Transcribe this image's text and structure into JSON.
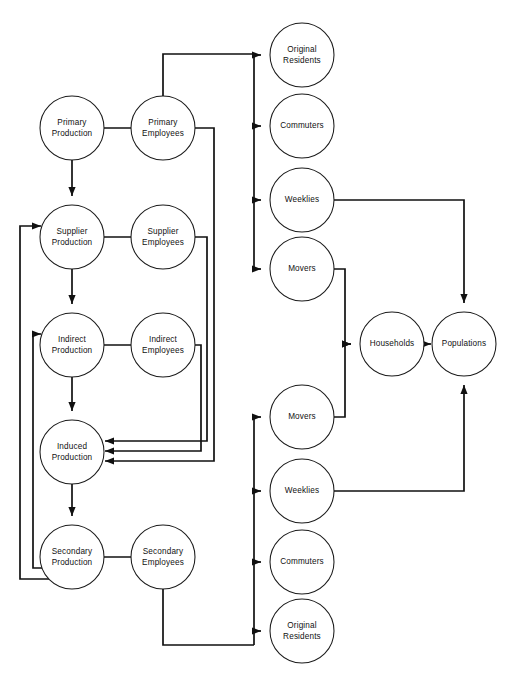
{
  "diagram": {
    "type": "flow-diagram",
    "title": "",
    "nodes": [
      {
        "id": "primary_production",
        "label_line1": "Primary",
        "label_line2": "Production",
        "cx": 72,
        "cy": 128,
        "r": 32
      },
      {
        "id": "primary_employees",
        "label_line1": "Primary",
        "label_line2": "Employees",
        "cx": 163,
        "cy": 128,
        "r": 32
      },
      {
        "id": "supplier_production",
        "label_line1": "Supplier",
        "label_line2": "Production",
        "cx": 72,
        "cy": 237,
        "r": 32
      },
      {
        "id": "supplier_employees",
        "label_line1": "Supplier",
        "label_line2": "Employees",
        "cx": 163,
        "cy": 237,
        "r": 32
      },
      {
        "id": "indirect_production",
        "label_line1": "Indirect",
        "label_line2": "Production",
        "cx": 72,
        "cy": 345,
        "r": 32
      },
      {
        "id": "indirect_employees",
        "label_line1": "Indirect",
        "label_line2": "Employees",
        "cx": 163,
        "cy": 345,
        "r": 32
      },
      {
        "id": "induced_production",
        "label_line1": "Induced",
        "label_line2": "Production",
        "cx": 72,
        "cy": 452,
        "r": 32
      },
      {
        "id": "secondary_production",
        "label_line1": "Secondary",
        "label_line2": "Production",
        "cx": 72,
        "cy": 557,
        "r": 32
      },
      {
        "id": "secondary_employees",
        "label_line1": "Secondary",
        "label_line2": "Employees",
        "cx": 163,
        "cy": 557,
        "r": 32
      },
      {
        "id": "original_residents_top",
        "label_line1": "Original",
        "label_line2": "Residents",
        "cx": 302,
        "cy": 55,
        "r": 32
      },
      {
        "id": "commuters_top",
        "label_line1": "Commuters",
        "label_line2": "",
        "cx": 302,
        "cy": 126,
        "r": 32
      },
      {
        "id": "weeklies_top",
        "label_line1": "Weeklies",
        "label_line2": "",
        "cx": 302,
        "cy": 200,
        "r": 32
      },
      {
        "id": "movers_top",
        "label_line1": "Movers",
        "label_line2": "",
        "cx": 302,
        "cy": 269,
        "r": 32
      },
      {
        "id": "households",
        "label_line1": "Households",
        "label_line2": "",
        "cx": 392,
        "cy": 344,
        "r": 32
      },
      {
        "id": "populations",
        "label_line1": "Populations",
        "label_line2": "",
        "cx": 464,
        "cy": 344,
        "r": 32
      },
      {
        "id": "movers_bottom",
        "label_line1": "Movers",
        "label_line2": "",
        "cx": 302,
        "cy": 417,
        "r": 32
      },
      {
        "id": "weeklies_bottom",
        "label_line1": "Weeklies",
        "label_line2": "",
        "cx": 302,
        "cy": 491,
        "r": 32
      },
      {
        "id": "commuters_bottom",
        "label_line1": "Commuters",
        "label_line2": "",
        "cx": 302,
        "cy": 562,
        "r": 32
      },
      {
        "id": "original_residents_bottom",
        "label_line1": "Original",
        "label_line2": "Residents",
        "cx": 302,
        "cy": 631,
        "r": 32
      }
    ],
    "edges": [
      {
        "id": "e-pp-pe",
        "from": "primary_production",
        "to": "primary_employees",
        "path": "M 104 128 L 154 128",
        "arrow_at": "154,128",
        "arrow_dir": "right"
      },
      {
        "id": "e-pp-sp",
        "from": "primary_production",
        "to": "supplier_production",
        "path": "M 72 160 L 72 196",
        "arrow_at": "72,196",
        "arrow_dir": "down"
      },
      {
        "id": "e-sp-se",
        "from": "supplier_production",
        "to": "supplier_employees",
        "path": "M 104 237 L 154 237",
        "arrow_at": "154,237",
        "arrow_dir": "right"
      },
      {
        "id": "e-sp-ip",
        "from": "supplier_production",
        "to": "indirect_production",
        "path": "M 72 269 L 72 304",
        "arrow_at": "72,304",
        "arrow_dir": "down"
      },
      {
        "id": "e-ip-ie",
        "from": "indirect_production",
        "to": "indirect_employees",
        "path": "M 104 345 L 154 345",
        "arrow_at": "154,345",
        "arrow_dir": "right"
      },
      {
        "id": "e-ip-indp",
        "from": "indirect_production",
        "to": "induced_production",
        "path": "M 72 377 L 72 411",
        "arrow_at": "72,411",
        "arrow_dir": "down"
      },
      {
        "id": "e-indp-sep",
        "from": "induced_production",
        "to": "secondary_production",
        "path": "M 72 484 L 72 516",
        "arrow_at": "72,516",
        "arrow_dir": "down"
      },
      {
        "id": "e-sep-see",
        "from": "secondary_production",
        "to": "secondary_employees",
        "path": "M 104 557 L 154 557",
        "arrow_at": "154,557",
        "arrow_dir": "right"
      },
      {
        "id": "e-see-ind1",
        "from": "supplier_employees",
        "to": "induced_production",
        "path": "M 195 237 L 207 237 L 207 441 L 105 441",
        "arrow_at": "105,441",
        "arrow_dir": "left"
      },
      {
        "id": "e-ie-ind2",
        "from": "indirect_employees",
        "to": "induced_production",
        "path": "M 195 345 L 201 345 L 201 451 L 105 451",
        "arrow_at": "105,451",
        "arrow_dir": "left"
      },
      {
        "id": "e-pe-ind3",
        "from": "primary_employees",
        "to": "induced_production",
        "path": "M 195 128 L 214 128 L 214 461 L 105 461",
        "arrow_at": "105,461",
        "arrow_dir": "left"
      },
      {
        "id": "e-secp-supp-fb",
        "from": "secondary_production",
        "to": "supplier_production",
        "path": "M 51 579 L 20 579 L 20 226 L 41 226",
        "arrow_at": "41,226",
        "arrow_dir": "right"
      },
      {
        "id": "e-secp-indp-fb",
        "from": "secondary_production",
        "to": "indirect_production",
        "path": "M 51 568 L 33 568 L 33 334 L 41 334",
        "arrow_at": "41,334",
        "arrow_dir": "right"
      },
      {
        "id": "e-pe-bus",
        "from": "primary_employees",
        "to": "distribution_bus_top",
        "path": "M 163 96 L 163 54 L 254 54",
        "arrow_at": "",
        "arrow_dir": "none"
      },
      {
        "id": "e-bus-top-vert",
        "from": "distribution_bus_top",
        "to": "distribution_bus_top_end",
        "path": "M 254 54 L 254 269",
        "arrow_at": "",
        "arrow_dir": "none"
      },
      {
        "id": "e-bus-or",
        "from": "distribution_bus_top",
        "to": "original_residents_top",
        "path": "M 254 55 L 261 55",
        "arrow_at": "261,55",
        "arrow_dir": "right"
      },
      {
        "id": "e-bus-com",
        "from": "distribution_bus_top",
        "to": "commuters_top",
        "path": "M 254 126 L 261 126",
        "arrow_at": "261,126",
        "arrow_dir": "right"
      },
      {
        "id": "e-bus-wk",
        "from": "distribution_bus_top",
        "to": "weeklies_top",
        "path": "M 254 200 L 261 200",
        "arrow_at": "261,200",
        "arrow_dir": "right"
      },
      {
        "id": "e-bus-mv",
        "from": "distribution_bus_top",
        "to": "movers_top",
        "path": "M 254 269 L 261 269",
        "arrow_at": "261,269",
        "arrow_dir": "right"
      },
      {
        "id": "e-see-bus2",
        "from": "secondary_employees",
        "to": "distribution_bus_bottom",
        "path": "M 163 589 L 163 645 L 254 645",
        "arrow_at": "",
        "arrow_dir": "none"
      },
      {
        "id": "e-bus-bot-vert",
        "from": "distribution_bus_bottom",
        "to": "distribution_bus_bottom_end",
        "path": "M 254 645 L 254 417",
        "arrow_at": "",
        "arrow_dir": "none"
      },
      {
        "id": "e-bus-or2",
        "from": "distribution_bus_bottom",
        "to": "original_residents_bottom",
        "path": "M 254 631 L 261 631",
        "arrow_at": "261,631",
        "arrow_dir": "right"
      },
      {
        "id": "e-bus-com2",
        "from": "distribution_bus_bottom",
        "to": "commuters_bottom",
        "path": "M 254 562 L 261 562",
        "arrow_at": "261,562",
        "arrow_dir": "right"
      },
      {
        "id": "e-bus-wk2",
        "from": "distribution_bus_bottom",
        "to": "weeklies_bottom",
        "path": "M 254 491 L 261 491",
        "arrow_at": "261,491",
        "arrow_dir": "right"
      },
      {
        "id": "e-bus-mv2",
        "from": "distribution_bus_bottom",
        "to": "movers_bottom",
        "path": "M 254 417 L 261 417",
        "arrow_at": "261,417",
        "arrow_dir": "right"
      },
      {
        "id": "e-mvtop-hh",
        "from": "movers_top",
        "to": "households",
        "path": "M 334 269 L 345 269 L 345 344 L 351 344",
        "arrow_at": "351,344",
        "arrow_dir": "right"
      },
      {
        "id": "e-mvbot-hh",
        "from": "movers_bottom",
        "to": "households",
        "path": "M 334 417 L 345 417 L 345 344 L 351 344",
        "arrow_at": "351,344",
        "arrow_dir": "right"
      },
      {
        "id": "e-hh-pop",
        "from": "households",
        "to": "populations",
        "path": "M 424 344 L 431 344",
        "arrow_at": "431,344",
        "arrow_dir": "right"
      },
      {
        "id": "e-wktop-pop",
        "from": "weeklies_top",
        "to": "populations",
        "path": "M 334 200 L 464 200 L 464 303",
        "arrow_at": "464,303",
        "arrow_dir": "down"
      },
      {
        "id": "e-wkbot-pop",
        "from": "weeklies_bottom",
        "to": "populations",
        "path": "M 334 491 L 464 491 L 464 385",
        "arrow_at": "464,385",
        "arrow_dir": "up"
      }
    ]
  },
  "style": {
    "stroke_color": "#111111",
    "node_fill": "#ffffff",
    "background": "#ffffff"
  }
}
